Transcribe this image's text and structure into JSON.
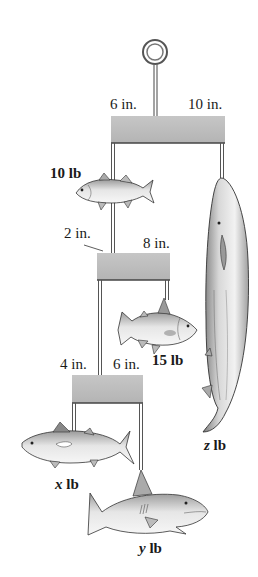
{
  "diagram": {
    "type": "hanging mobile with fish",
    "colors": {
      "bar_fill": "#bdbdbd",
      "bar_edge": "#555555",
      "string": "#555555",
      "fish_light": "#e8e8e8",
      "fish_dark": "#8a8a8a",
      "text": "#1a1a1a"
    },
    "top_bar": {
      "left_arm_label": "6 in.",
      "right_arm_label": "10 in."
    },
    "middle_bar": {
      "left_arm_label": "2 in.",
      "right_arm_label": "8 in."
    },
    "bottom_bar": {
      "left_arm_label": "4 in.",
      "right_arm_label": "6 in."
    },
    "weights": {
      "fish_10": "10 lb",
      "fish_15": "15 lb",
      "fish_x_var": "x",
      "fish_x_unit": " lb",
      "fish_y_var": "y",
      "fish_y_unit": " lb",
      "fish_z_var": "z",
      "fish_z_unit": " lb"
    }
  }
}
